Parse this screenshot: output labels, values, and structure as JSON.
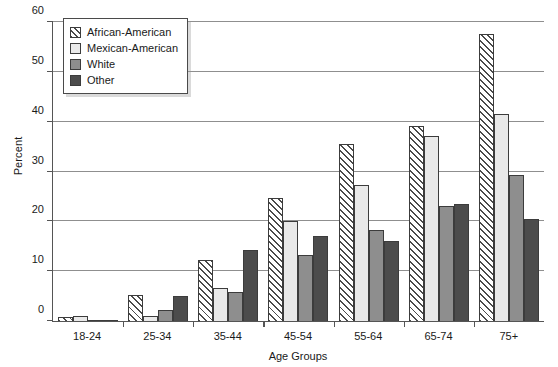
{
  "chart_data": {
    "type": "bar",
    "title": "",
    "xlabel": "Age Groups",
    "ylabel": "Percent",
    "ylim": [
      0,
      60
    ],
    "ytick_step": 10,
    "yticks": [
      0,
      10,
      20,
      30,
      40,
      50,
      60
    ],
    "grid": "horizontal",
    "legend_position": "top-left-inside",
    "categories": [
      "18-24",
      "25-34",
      "35-44",
      "45-54",
      "55-64",
      "65-74",
      "75+"
    ],
    "series": [
      {
        "name": "African-American",
        "color": "#ffffff",
        "pattern": "diagonal-hatch",
        "values": [
          0.9,
          5.2,
          12.3,
          24.6,
          35.5,
          39.1,
          57.6
        ]
      },
      {
        "name": "Mexican-American",
        "color": "#e9e9e9",
        "pattern": "solid",
        "values": [
          1.0,
          1.1,
          6.6,
          20.0,
          27.3,
          37.2,
          41.5
        ]
      },
      {
        "name": "White",
        "color": "#8e8e8e",
        "pattern": "solid",
        "values": [
          0.2,
          2.3,
          5.8,
          13.2,
          18.3,
          23.0,
          29.4
        ]
      },
      {
        "name": "Other",
        "color": "#4c4c4c",
        "pattern": "solid",
        "values": [
          0.2,
          5.0,
          14.3,
          17.0,
          16.0,
          23.4,
          20.5
        ]
      }
    ]
  },
  "axes": {
    "y_title": "Percent",
    "x_title": "Age Groups",
    "y_tick_labels": [
      "0",
      "10",
      "20",
      "30",
      "40",
      "50",
      "60"
    ],
    "x_tick_labels": [
      "18-24",
      "25-34",
      "35-44",
      "45-54",
      "55-64",
      "65-74",
      "75+"
    ]
  },
  "legend": {
    "items": [
      {
        "label": "African-American"
      },
      {
        "label": "Mexican-American"
      },
      {
        "label": "White"
      },
      {
        "label": "Other"
      }
    ]
  }
}
